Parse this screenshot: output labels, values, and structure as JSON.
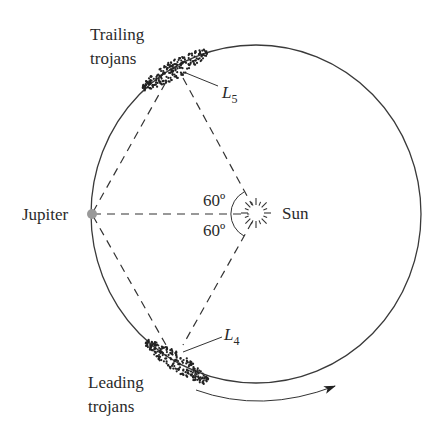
{
  "diagram": {
    "labels": {
      "trailing_line1": "Trailing",
      "trailing_line2": "trojans",
      "leading_line1": "Leading",
      "leading_line2": "trojans",
      "jupiter": "Jupiter",
      "sun": "Sun",
      "l5_main": "L",
      "l5_sub": "5",
      "l4_main": "L",
      "l4_sub": "4",
      "angle_upper": "60º",
      "angle_lower": "60º"
    },
    "nodes": [
      {
        "id": "jupiter",
        "label": "Jupiter",
        "x": 91,
        "y": 214
      },
      {
        "id": "sun",
        "label": "Sun",
        "x": 256,
        "y": 213
      },
      {
        "id": "L5",
        "label": "L5",
        "x": 174,
        "y": 70
      },
      {
        "id": "L4",
        "label": "L4",
        "x": 176,
        "y": 356
      }
    ],
    "edges": [
      {
        "from": "jupiter",
        "to": "sun",
        "style": "dashed"
      },
      {
        "from": "jupiter",
        "to": "L5",
        "style": "dashed"
      },
      {
        "from": "jupiter",
        "to": "L4",
        "style": "dashed"
      },
      {
        "from": "sun",
        "to": "L5",
        "style": "dashed"
      },
      {
        "from": "sun",
        "to": "L4",
        "style": "dashed"
      }
    ],
    "angles": [
      {
        "vertex": "sun",
        "between": [
          "jupiter",
          "L5"
        ],
        "value": "60º"
      },
      {
        "vertex": "sun",
        "between": [
          "jupiter",
          "L4"
        ],
        "value": "60º"
      }
    ],
    "orbit": {
      "shape": "circle",
      "center_x": 256,
      "center_y": 214,
      "rx": 165,
      "ry": 169
    },
    "motion_arrow": {
      "direction": "counterclockwise (left to right along bottom)"
    },
    "colors": {
      "line": "#333333",
      "jupiter": "#999999",
      "text": "#2a2a2a",
      "background": "#ffffff"
    }
  }
}
